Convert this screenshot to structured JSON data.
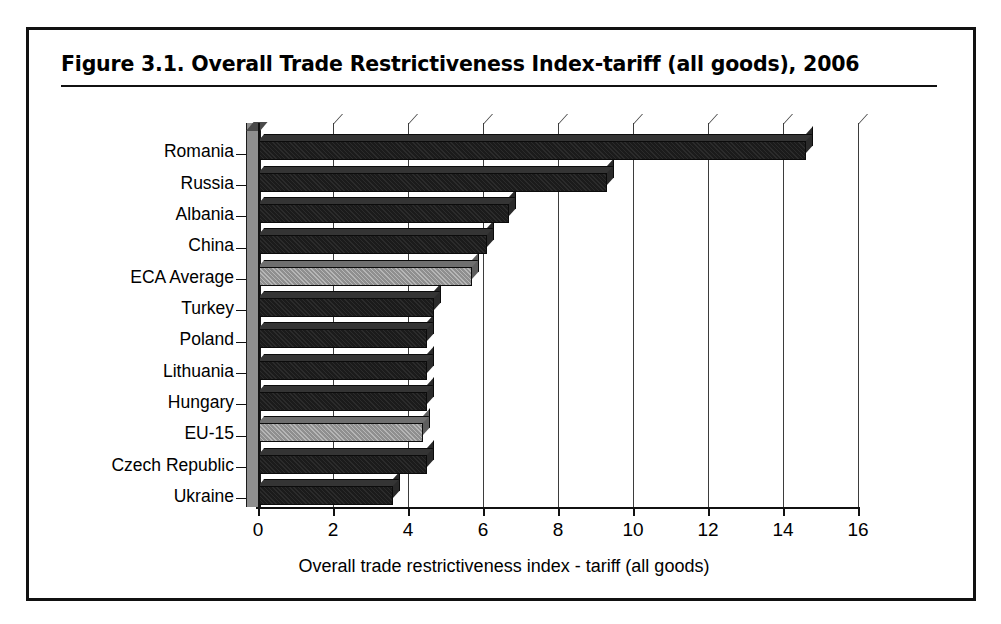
{
  "figure": {
    "title": "Figure 3.1.  Overall Trade Restrictiveness Index-tariff (all goods), 2006",
    "x_axis_title": "Overall trade restrictiveness index - tariff (all goods)"
  },
  "colors": {
    "bar_dark": "#1b1b1b",
    "bar_light": "#8f8f8f",
    "outline": "#0b0b0b",
    "axis": "#111111",
    "gridline": "#3d3d3d",
    "page_background": "#ffffff"
  },
  "chart_data": {
    "type": "bar",
    "orientation": "horizontal",
    "title": "Figure 3.1.  Overall Trade Restrictiveness Index-tariff (all goods), 2006",
    "xlabel": "Overall trade restrictiveness index - tariff (all goods)",
    "ylabel": "",
    "xlim": [
      0,
      16
    ],
    "xticks": [
      0,
      2,
      4,
      6,
      8,
      10,
      12,
      14,
      16
    ],
    "xtick_labels": [
      "0",
      "2",
      "4",
      "6",
      "8",
      "10",
      "12",
      "14",
      "16"
    ],
    "grid": true,
    "grid_axis": "x",
    "legend": false,
    "highlight_note": "Aggregate rows (ECA Average, EU-15) drawn in light gray; country rows in black",
    "categories": [
      "Romania",
      "Russia",
      "Albania",
      "China",
      "ECA Average",
      "Turkey",
      "Poland",
      "Lithuania",
      "Hungary",
      "EU-15",
      "Czech Republic",
      "Ukraine"
    ],
    "values": [
      14.6,
      9.3,
      6.7,
      6.1,
      5.7,
      4.7,
      4.5,
      4.5,
      4.5,
      4.4,
      4.5,
      3.6
    ],
    "bar_styles": [
      "dark",
      "dark",
      "dark",
      "dark",
      "light",
      "dark",
      "dark",
      "dark",
      "dark",
      "light",
      "dark",
      "dark"
    ]
  }
}
